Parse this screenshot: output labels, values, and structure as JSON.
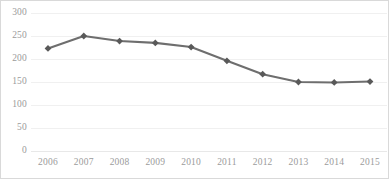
{
  "chart_data": {
    "type": "line",
    "title": "",
    "subtitle": "",
    "xlabel": "",
    "ylabel": "",
    "categories": [
      "2006",
      "2007",
      "2008",
      "2009",
      "2010",
      "2011",
      "2012",
      "2013",
      "2014",
      "2015"
    ],
    "values": [
      223,
      250,
      239,
      235,
      226,
      196,
      167,
      150,
      149,
      151
    ],
    "series": [
      {
        "name": "Series 1",
        "values": [
          223,
          250,
          239,
          235,
          226,
          196,
          167,
          150,
          149,
          151
        ]
      }
    ],
    "ylim": [
      0,
      300
    ],
    "yticks": [
      0,
      50,
      100,
      150,
      200,
      250,
      300
    ],
    "ytick_labels": [
      "0",
      "50",
      "100",
      "150",
      "200",
      "250",
      "300"
    ],
    "xtick_labels": [
      "2006",
      "2007",
      "2008",
      "2009",
      "2010",
      "2011",
      "2012",
      "2013",
      "2014",
      "2015"
    ],
    "grid": true,
    "grid_axis": "y",
    "legend": false,
    "legend_position": "none",
    "marker": "diamond",
    "line_color": "#6e6e6e",
    "marker_color": "#595959",
    "grid_color": "#f0f0f0",
    "tick_label_color": "#9b9b9b",
    "background_color": "#ffffff",
    "border_color": "#d9d9d9",
    "annotations": []
  }
}
